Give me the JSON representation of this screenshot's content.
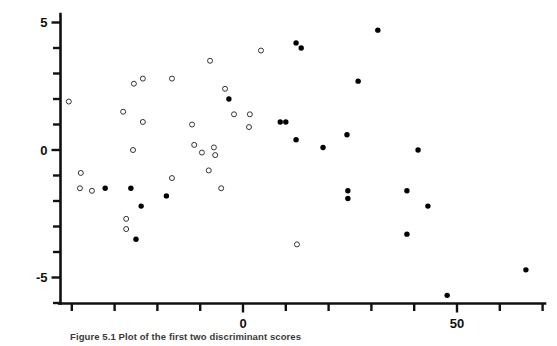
{
  "figure": {
    "caption": "Figure 5.1  Plot of the first two discriminant scores",
    "axis_color": "#111111",
    "open_marker_color": "#333333",
    "filled_marker_color": "#000000"
  },
  "chart_data": {
    "type": "scatter",
    "title": "",
    "xlabel": "",
    "ylabel": "",
    "xlim": [
      -45,
      75
    ],
    "ylim": [
      -6.5,
      5.6
    ],
    "grid": false,
    "legend": "none",
    "x_ticks": [
      -40,
      -30,
      -20,
      -10,
      0,
      10,
      20,
      30,
      40,
      50,
      60,
      70
    ],
    "x_tick_labels": [
      "",
      "",
      "",
      "",
      "0",
      "",
      "",
      "",
      "",
      "50",
      "",
      ""
    ],
    "y_ticks": [
      -6,
      -5,
      -4,
      -3,
      -2,
      -1,
      0,
      1,
      2,
      3,
      4,
      5
    ],
    "y_tick_labels": [
      "",
      "-5",
      "",
      "",
      "",
      "",
      "0",
      "",
      "",
      "",
      "",
      "5"
    ],
    "series": [
      {
        "name": "open-circles",
        "marker": "open-circle",
        "points": [
          [
            -40.7,
            1.9
          ],
          [
            -38.1,
            -1.5
          ],
          [
            -25.5,
            2.6
          ],
          [
            -23.4,
            2.8
          ],
          [
            -16.6,
            2.8
          ],
          [
            -28.0,
            1.5
          ],
          [
            -23.4,
            1.1
          ],
          [
            -25.7,
            0.0
          ],
          [
            -16.6,
            -1.1
          ],
          [
            -7.7,
            3.5
          ],
          [
            -4.2,
            2.4
          ],
          [
            4.2,
            3.9
          ],
          [
            -2.1,
            1.4
          ],
          [
            1.6,
            1.4
          ],
          [
            -11.9,
            1.0
          ],
          [
            1.4,
            0.9
          ],
          [
            -11.4,
            0.2
          ],
          [
            -9.6,
            -0.1
          ],
          [
            -6.5,
            -0.2
          ],
          [
            -37.9,
            -0.9
          ],
          [
            -35.3,
            -1.6
          ],
          [
            -6.8,
            0.1
          ],
          [
            -8.0,
            -0.8
          ],
          [
            -5.1,
            -1.5
          ],
          [
            -27.3,
            -2.7
          ],
          [
            -27.3,
            -3.1
          ],
          [
            12.6,
            -3.7
          ]
        ]
      },
      {
        "name": "filled-circles",
        "marker": "filled-circle",
        "points": [
          [
            12.4,
            4.2
          ],
          [
            13.6,
            4.0
          ],
          [
            -3.3,
            2.0
          ],
          [
            8.7,
            1.1
          ],
          [
            10.0,
            1.1
          ],
          [
            12.4,
            0.4
          ],
          [
            31.5,
            4.7
          ],
          [
            26.9,
            2.7
          ],
          [
            24.3,
            0.6
          ],
          [
            18.7,
            0.1
          ],
          [
            40.9,
            0.0
          ],
          [
            -32.2,
            -1.5
          ],
          [
            -26.2,
            -1.5
          ],
          [
            -23.8,
            -2.2
          ],
          [
            -25.0,
            -3.5
          ],
          [
            -17.9,
            -1.8
          ],
          [
            24.5,
            -1.6
          ],
          [
            24.5,
            -1.9
          ],
          [
            38.3,
            -1.6
          ],
          [
            43.2,
            -2.2
          ],
          [
            38.3,
            -3.3
          ],
          [
            66.1,
            -4.7
          ],
          [
            47.7,
            -5.7
          ]
        ]
      }
    ]
  }
}
